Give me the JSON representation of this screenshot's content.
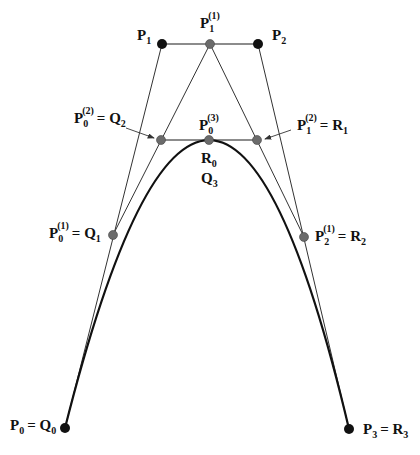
{
  "diagram": {
    "type": "de Casteljau subdivision of a cubic Bezier curve at t = 1/2",
    "colors": {
      "background": "#ffffff",
      "control_line": "#333333",
      "curve": "#111111",
      "control_point": "#111111",
      "intermediate_point": "#6b6b6b"
    },
    "control_points": [
      {
        "id": "P0",
        "x": 65,
        "y": 428,
        "kind": "control"
      },
      {
        "id": "P1",
        "x": 162,
        "y": 44,
        "kind": "control"
      },
      {
        "id": "P2",
        "x": 258,
        "y": 44,
        "kind": "control"
      },
      {
        "id": "P3",
        "x": 349,
        "y": 429,
        "kind": "control"
      }
    ],
    "intermediate_points": [
      {
        "id": "P0_1",
        "x": 113,
        "y": 235,
        "kind": "intermediate"
      },
      {
        "id": "P1_1",
        "x": 210,
        "y": 44,
        "kind": "intermediate"
      },
      {
        "id": "P2_1",
        "x": 304,
        "y": 237,
        "kind": "intermediate"
      },
      {
        "id": "P0_2",
        "x": 161,
        "y": 140,
        "kind": "intermediate"
      },
      {
        "id": "P1_2",
        "x": 257,
        "y": 140,
        "kind": "intermediate"
      },
      {
        "id": "P0_3",
        "x": 209,
        "y": 140,
        "kind": "intermediate"
      }
    ],
    "labels": {
      "p1": {
        "base": "P",
        "sub": "1",
        "sup": "",
        "rhs": ""
      },
      "p1_1": {
        "base": "P",
        "sub": "1",
        "sup": "(1)",
        "rhs": ""
      },
      "p2": {
        "base": "P",
        "sub": "2",
        "sup": "",
        "rhs": ""
      },
      "p0_2": {
        "base": "P",
        "sub": "0",
        "sup": "(2)",
        "rhs": "= Q",
        "rhs_sub": "2"
      },
      "p0_3": {
        "base": "P",
        "sub": "0",
        "sup": "(3)",
        "rhs": ""
      },
      "p1_2": {
        "base": "P",
        "sub": "1",
        "sup": "(2)",
        "rhs": "= R",
        "rhs_sub": "1"
      },
      "r0": {
        "base": "R",
        "sub": "0"
      },
      "q3": {
        "base": "Q",
        "sub": "3"
      },
      "p0_1": {
        "base": "P",
        "sub": "0",
        "sup": "(1)",
        "rhs": "= Q",
        "rhs_sub": "1"
      },
      "p2_1": {
        "base": "P",
        "sub": "2",
        "sup": "(1)",
        "rhs": "= R",
        "rhs_sub": "2"
      },
      "p0": {
        "base": "P",
        "sub": "0",
        "rhs": "= Q",
        "rhs_sub": "0"
      },
      "p3": {
        "base": "P",
        "sub": "3",
        "rhs": "= R",
        "rhs_sub": "3"
      }
    }
  }
}
